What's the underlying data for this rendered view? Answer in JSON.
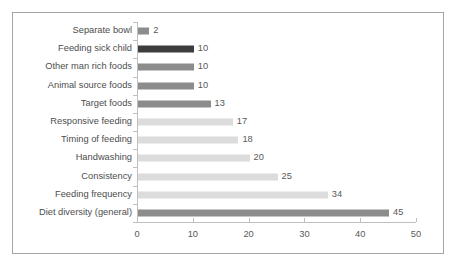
{
  "chart_data": {
    "type": "bar",
    "orientation": "horizontal",
    "title": "",
    "xlabel": "",
    "ylabel": "",
    "xlim": [
      0,
      50
    ],
    "xticks": [
      "0",
      "10",
      "20",
      "30",
      "40",
      "50"
    ],
    "grid": false,
    "legend": null,
    "categories": [
      "Separate bowl",
      "Feeding sick child",
      "Other man rich foods",
      "Animal source foods",
      "Target foods",
      "Responsive feeding",
      "Timing of feeding",
      "Handwashing",
      "Consistency",
      "Feeding frequency",
      "Diet diversity (general)"
    ],
    "values": [
      2,
      10,
      10,
      10,
      13,
      17,
      18,
      20,
      25,
      34,
      45
    ],
    "data_labels": [
      "2",
      "10",
      "10",
      "10",
      "13",
      "17",
      "18",
      "20",
      "25",
      "34",
      "45"
    ],
    "bar_shades": [
      "medium",
      "dark",
      "medium",
      "medium",
      "medium",
      "light",
      "light",
      "light",
      "light",
      "light",
      "medium"
    ]
  },
  "colors": {
    "bar_dark": "#3d3d3d",
    "bar_medium": "#8c8c8c",
    "bar_light": "#dcdcdc",
    "axis": "#bfbfbf",
    "border": "#a6a6a6",
    "label_text": "#4d4d4d",
    "value_text": "#595959",
    "background": "#ffffff"
  }
}
